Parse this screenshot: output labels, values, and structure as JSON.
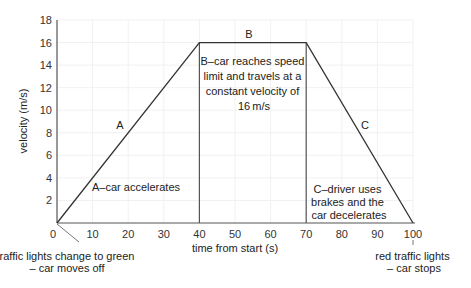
{
  "chart_data": {
    "type": "line",
    "title": "",
    "xlabel": "time from start (s)",
    "ylabel": "velocity (m/s)",
    "xlim": [
      0,
      100
    ],
    "ylim": [
      0,
      18
    ],
    "grid": true,
    "x_ticks": [
      0,
      10,
      20,
      30,
      40,
      50,
      60,
      70,
      80,
      90,
      100
    ],
    "y_ticks": [
      2,
      4,
      6,
      8,
      10,
      12,
      14,
      16,
      18
    ],
    "series": [
      {
        "name": "velocity",
        "x": [
          0,
          40,
          70,
          100
        ],
        "y": [
          0,
          16,
          16,
          0
        ]
      }
    ],
    "vertical_lines": [
      40,
      70
    ],
    "segment_labels": [
      {
        "id": "A",
        "text": "A"
      },
      {
        "id": "B",
        "text": "B"
      },
      {
        "id": "C",
        "text": "C"
      }
    ],
    "annotations": {
      "a_desc": "A–car accelerates",
      "b_desc": [
        "B–car reaches speed",
        "limit and travels at a",
        "constant velocity of",
        "16 m/s"
      ],
      "c_desc": [
        "C–driver uses",
        "brakes and the",
        "car decelerates"
      ],
      "start_note": [
        "traffic lights change to green",
        "– car moves off"
      ],
      "end_note": [
        "red traffic lights",
        "– car stops"
      ]
    }
  }
}
